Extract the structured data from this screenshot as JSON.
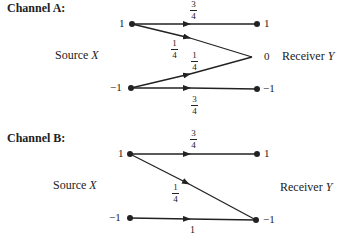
{
  "channels": [
    {
      "title": "Channel A:",
      "source_label": "Source",
      "source_var": "X",
      "receiver_label": "Receiver",
      "receiver_var": "Y",
      "source_nodes": [
        "1",
        "−1"
      ],
      "receiver_nodes": [
        "1",
        "0",
        "−1"
      ],
      "transitions": [
        {
          "from": "1",
          "to": "1",
          "num": "3",
          "den": "4"
        },
        {
          "from": "1",
          "to": "0",
          "num": "1",
          "den": "4"
        },
        {
          "from": "−1",
          "to": "0",
          "num": "1",
          "den": "4"
        },
        {
          "from": "−1",
          "to": "−1",
          "num": "3",
          "den": "4"
        }
      ]
    },
    {
      "title": "Channel B:",
      "source_label": "Source",
      "source_var": "X",
      "receiver_label": "Receiver",
      "receiver_var": "Y",
      "source_nodes": [
        "1",
        "−1"
      ],
      "receiver_nodes": [
        "1",
        "−1"
      ],
      "transitions": [
        {
          "from": "1",
          "to": "1",
          "num": "3",
          "den": "4"
        },
        {
          "from": "1",
          "to": "−1",
          "num": "1",
          "den": "4"
        },
        {
          "from": "−1",
          "to": "−1",
          "value": "1"
        }
      ]
    }
  ]
}
